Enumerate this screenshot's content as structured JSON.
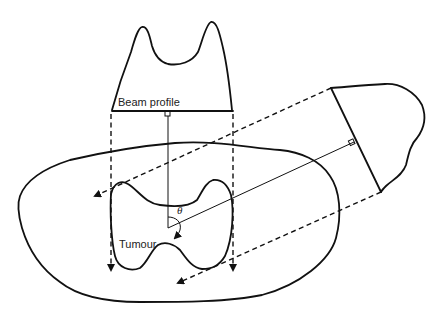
{
  "diagram": {
    "labels": {
      "beam_profile": "Beam profile",
      "tumour": "Tumour",
      "angle": "θ"
    },
    "elements": {
      "body_outline": "patient body contour",
      "tumour_outline": "tumour contour",
      "beam_profile_top": "beam profile at 0°",
      "beam_profile_rotated": "beam profile rotated by angle θ",
      "beam_edges": "dashed beam edge projections with arrows",
      "central_axes": "central beam axes meeting at isocentre"
    },
    "colors": {
      "stroke": "#111111",
      "background": "#ffffff"
    }
  }
}
